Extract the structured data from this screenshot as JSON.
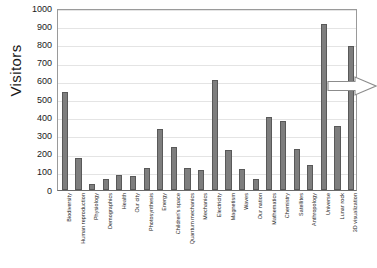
{
  "chart_data": {
    "type": "bar",
    "title": "",
    "xlabel": "",
    "ylabel": "Visitors",
    "ylim": [
      0,
      1000
    ],
    "ytick_step": 100,
    "yticks": [
      "1000",
      "900",
      "800",
      "700",
      "600",
      "500",
      "400",
      "300",
      "200",
      "100",
      "0"
    ],
    "grid": true,
    "legend": "none",
    "bar_color": "#7e7e7e",
    "bar_border_color": "#595959",
    "categories": [
      "Biodiversity",
      "Human reproduction",
      "Physiology",
      "Demographics",
      "Health",
      "Our city",
      "Photosynthesis",
      "Energy",
      "Children's space",
      "Quantum mechanics",
      "Mechanics",
      "Electricity",
      "Magnetism",
      "Waves",
      "Our nation",
      "Mathematics",
      "Chemistry",
      "Satellites",
      "Anthropology",
      "Universe",
      "Lunar rock",
      "3D visualization"
    ],
    "values": [
      537,
      177,
      33,
      60,
      80,
      76,
      119,
      335,
      236,
      121,
      112,
      604,
      220,
      115,
      62,
      402,
      381,
      223,
      140,
      912,
      350,
      790
    ],
    "annotations": [
      {
        "name": "right-arrow",
        "shape": "block-arrow",
        "direction": "right",
        "points_at": "Universe",
        "fill": "#ffffff",
        "stroke": "#8c8c8c"
      }
    ]
  }
}
